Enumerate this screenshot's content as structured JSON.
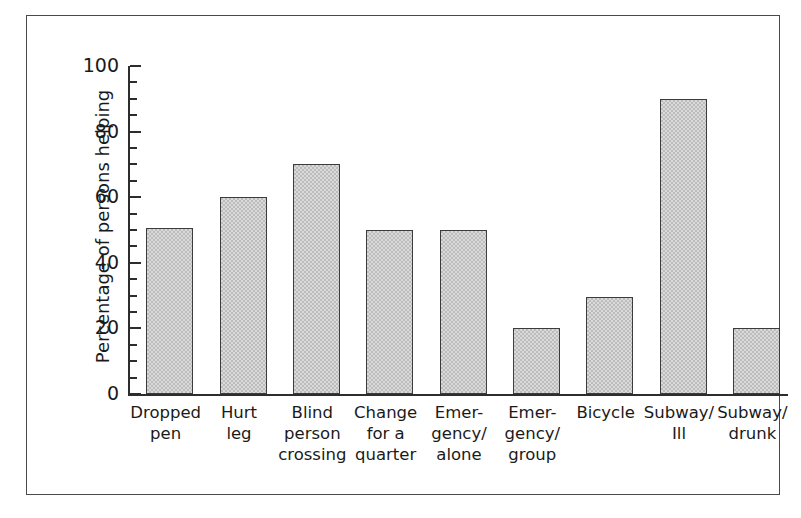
{
  "chart_data": {
    "type": "bar",
    "title": "",
    "subtitle": "",
    "xlabel": "",
    "ylabel": "Percentage of persons helping",
    "ylim": [
      0,
      100
    ],
    "ytick_labels": [
      "0",
      "20",
      "40",
      "60",
      "80",
      "100"
    ],
    "ytick_values": [
      0,
      20,
      40,
      60,
      80,
      100
    ],
    "minor_tick_interval": 5,
    "grid": false,
    "legend": null,
    "bar_color": "#bcbcbc",
    "bar_edge_color": "#3c3c3c",
    "axis_color": "#2d2d2d",
    "frame_color": "#4a4a4a",
    "categories": [
      "Dropped\npen",
      "Hurt\nleg",
      "Blind\nperson\ncrossing",
      "Change\nfor a\nquarter",
      "Emer-\ngency/\nalone",
      "Emer-\ngency/\ngroup",
      "Bicycle",
      "Subway/\nIll",
      "Subway/\ndrunk"
    ],
    "values": [
      50.5,
      60,
      70,
      50,
      50,
      20,
      29.5,
      90,
      20
    ]
  }
}
